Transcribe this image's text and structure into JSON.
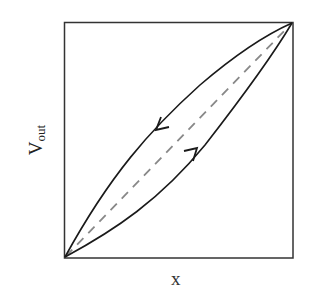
{
  "diagram": {
    "type": "hysteresis-loop",
    "axes": {
      "xlabel": "x",
      "ylabel_main": "V",
      "ylabel_sub": "out"
    },
    "curves": [
      {
        "name": "upper-branch",
        "direction": "decreasing",
        "arrow": "down-left"
      },
      {
        "name": "lower-branch",
        "direction": "increasing",
        "arrow": "up-right"
      },
      {
        "name": "reference-diagonal",
        "style": "dashed"
      }
    ],
    "colors": {
      "frame": "#333333",
      "curve": "#1a1a1a",
      "dashed": "#888888"
    }
  }
}
